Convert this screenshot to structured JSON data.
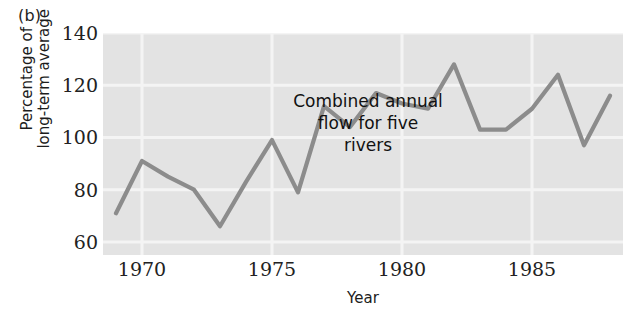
{
  "panel": {
    "label": "(b)"
  },
  "annotation": {
    "text": "Combined annual\nflow for five\nrivers"
  },
  "axis": {
    "ylabel": "Percentage of\nlong-term average",
    "xlabel": "Year"
  },
  "colors": {
    "line": "#8c8c8c",
    "plot_background": "#e3e3e3",
    "gridline": "#f4f4f4",
    "text": "#1a1a1a"
  },
  "chart_data": {
    "type": "line",
    "title": "Combined annual flow for five rivers",
    "xlabel": "Year",
    "ylabel": "Percentage of long-term average",
    "xlim": [
      1968.5,
      1988.5
    ],
    "ylim": [
      55,
      140
    ],
    "xticks": [
      1970,
      1975,
      1980,
      1985
    ],
    "yticks": [
      60,
      80,
      100,
      120,
      140
    ],
    "grid": true,
    "legend": null,
    "x": [
      1969,
      1970,
      1971,
      1972,
      1973,
      1974,
      1975,
      1976,
      1977,
      1978,
      1979,
      1980,
      1981,
      1982,
      1983,
      1984,
      1985,
      1986,
      1987,
      1988
    ],
    "values": [
      71,
      91,
      85,
      80,
      66,
      83,
      99,
      79,
      112,
      104,
      117,
      113,
      111,
      128,
      103,
      103,
      111,
      124,
      97,
      116
    ],
    "series": [
      {
        "name": "Combined annual flow for five rivers",
        "values": [
          71,
          91,
          85,
          80,
          66,
          83,
          99,
          79,
          112,
          104,
          117,
          113,
          111,
          128,
          103,
          103,
          111,
          124,
          97,
          116
        ]
      }
    ],
    "annotations": [
      {
        "text": "Combined annual flow for five rivers",
        "x": 1974.5,
        "y": 128
      }
    ]
  }
}
